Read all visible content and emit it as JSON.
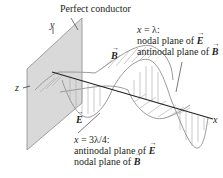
{
  "diagram": {
    "title_label": "Perfect conductor",
    "axes": {
      "y": "y",
      "z": "z",
      "x": "x"
    },
    "vectors": {
      "B": "B",
      "E": "E"
    },
    "annotation_top": {
      "line1_var": "x",
      "line1_rest": " = λ:",
      "line2_text": "nodal plane of ",
      "line2_vec": "E",
      "line3_text": "antinodal plane of ",
      "line3_vec": "B"
    },
    "annotation_bottom": {
      "line1_var": "x",
      "line1_rest": " = 3λ/4:",
      "line2_text": "antinodal plane of ",
      "line2_vec": "E",
      "line3_text": "nodal plane of ",
      "line3_vec": "B"
    },
    "colors": {
      "plane_fill": "#d9d9da",
      "plane_edge": "#8a8a8c",
      "wave_stroke": "#9a9a9c",
      "axis": "#231f20",
      "hatch": "#a8a8aa"
    }
  }
}
